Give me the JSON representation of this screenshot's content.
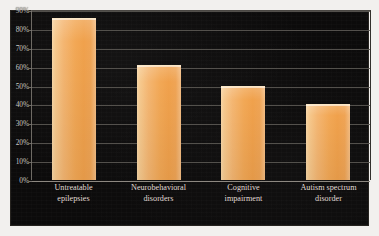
{
  "chart_data": {
    "type": "bar",
    "title": "",
    "subtitle": "",
    "xlabel": "",
    "ylabel": "",
    "categories": [
      "Untreatable epilepsies",
      "Neurobehavioral disorders",
      "Cognitive impairment",
      "Autism spectrum disorder"
    ],
    "category_lines": [
      [
        "Untreatable",
        "epilepsies"
      ],
      [
        "Neurobehavioral",
        "disorders"
      ],
      [
        "Cognitive",
        "impairment"
      ],
      [
        "Autism spectrum",
        "disorder"
      ]
    ],
    "values": [
      86,
      61,
      50,
      40
    ],
    "value_labels": [
      "86%",
      "61%",
      "50%",
      "40%"
    ],
    "ylim": [
      0,
      90
    ],
    "ytick_values": [
      0,
      10,
      20,
      30,
      40,
      50,
      60,
      70,
      80,
      90
    ],
    "ytick_labels": [
      "0%",
      "10%",
      "20%",
      "30%",
      "40%",
      "50%",
      "60%",
      "70%",
      "80%",
      "90%"
    ],
    "grid": true,
    "legend": false,
    "legend_position": "none",
    "series": [
      {
        "name": "Prevalence",
        "values": [
          86,
          61,
          50,
          40
        ]
      }
    ]
  },
  "style": {
    "panel_background": "#0c0b0b",
    "figure_background": "#f2f0ee",
    "bar_color": "#f2a856",
    "bar_highlight": "#f7d6a6",
    "gridline_color": "#5d5a55",
    "axis_text_color": "#cfcac4",
    "category_text_color": "#e2ded8"
  }
}
